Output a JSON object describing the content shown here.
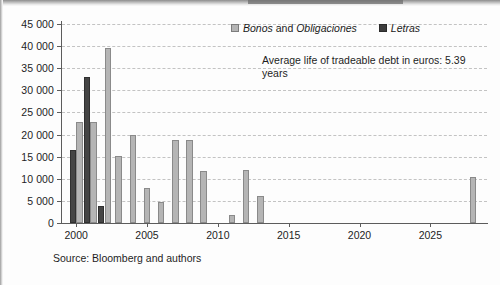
{
  "figure": {
    "source_note": "Source: Bloomberg and authors",
    "annotation": "Average life of tradeable debt in euros: 5.39 years",
    "colors": {
      "bonos": "#b5b5b5",
      "letras": "#3d3d3d",
      "axis": "#5c5c5c",
      "grid": "#c3c3c3",
      "background": "#fdfdfd"
    }
  },
  "legend": {
    "position": "top-right",
    "items": [
      {
        "label_italic_1": "Bonos",
        "label_plain": " and ",
        "label_italic_2": "Obligaciones",
        "key": "bonos",
        "swatch": "light-grey-square"
      },
      {
        "label_italic_1": "Letras",
        "label_plain": "",
        "label_italic_2": "",
        "key": "letras",
        "swatch": "dark-grey-square"
      }
    ]
  },
  "chart_data": {
    "type": "bar",
    "title": "",
    "subtitle": "",
    "xlabel": "",
    "ylabel": "",
    "xlim": [
      1999.0,
      2029.0
    ],
    "ylim": [
      0,
      45000
    ],
    "ytick_values": [
      0,
      5000,
      10000,
      15000,
      20000,
      25000,
      30000,
      35000,
      40000,
      45000
    ],
    "ytick_labels": [
      "0",
      "5 000",
      "10 000",
      "15 000",
      "20 000",
      "25 000",
      "30 000",
      "35 000",
      "40 000",
      "45 000"
    ],
    "xtick_values": [
      2000,
      2005,
      2010,
      2015,
      2020,
      2025
    ],
    "xtick_labels": [
      "2000",
      "2005",
      "2010",
      "2015",
      "2020",
      "2025"
    ],
    "grid": "horizontal-dashed",
    "legend_position": "upper right",
    "annotations": [
      {
        "text": "Average life of tradeable debt in euros: 5.39 years",
        "x": 2012,
        "y": 30000
      }
    ],
    "x": [
      2000,
      2001,
      2002,
      2003,
      2004,
      2005,
      2006,
      2007,
      2008,
      2009,
      2011,
      2012,
      2013,
      2028
    ],
    "series": [
      {
        "name": "Bonos and Obligaciones",
        "key": "bonos",
        "color": "#b5b5b5",
        "values": [
          22800,
          22800,
          39500,
          15200,
          19800,
          8000,
          4800,
          18700,
          18800,
          11800,
          1700,
          11900,
          6000,
          10500
        ]
      },
      {
        "name": "Letras",
        "key": "letras",
        "color": "#3d3d3d",
        "values": [
          16500,
          33000,
          3800,
          0,
          0,
          0,
          0,
          0,
          0,
          0,
          0,
          0,
          0,
          0
        ]
      }
    ]
  }
}
